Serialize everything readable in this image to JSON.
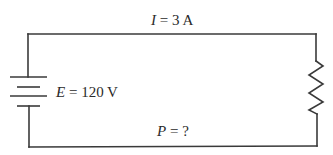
{
  "diagram": {
    "type": "series-circuit",
    "colors": {
      "wire": "#3a3a3a",
      "text": "#2a2a2a",
      "background": "#ffffff"
    },
    "components": [
      {
        "kind": "battery",
        "icon": "battery-icon",
        "position": "left-side"
      },
      {
        "kind": "resistor",
        "icon": "resistor-icon",
        "position": "right-side"
      }
    ],
    "labels": {
      "current": {
        "symbol": "I",
        "equals": " = ",
        "value": "3 A"
      },
      "emf": {
        "symbol": "E",
        "equals": " = ",
        "value": "120 V"
      },
      "power": {
        "symbol": "P",
        "equals": " = ",
        "value": "?"
      }
    }
  }
}
